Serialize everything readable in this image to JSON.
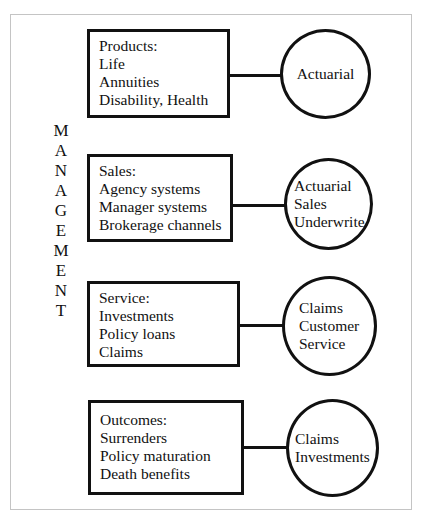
{
  "diagram": {
    "side_label": "MANAGEMENT",
    "side_letters": [
      "M",
      "A",
      "N",
      "A",
      "G",
      "E",
      "M",
      "E",
      "N",
      "T"
    ],
    "rows": [
      {
        "box": {
          "title": "Products:",
          "items": [
            "Life",
            "Annuities",
            "Disability, Health"
          ]
        },
        "circle": {
          "lines": [
            "Actuarial"
          ]
        }
      },
      {
        "box": {
          "title": "Sales:",
          "items": [
            "Agency systems",
            "Manager systems",
            "Brokerage channels"
          ]
        },
        "circle": {
          "lines": [
            "Actuarial",
            "Sales",
            "Underwrite"
          ]
        }
      },
      {
        "box": {
          "title": "Service:",
          "items": [
            "Investments",
            "Policy loans",
            "Claims"
          ]
        },
        "circle": {
          "lines": [
            "Claims",
            "Customer",
            "Service"
          ]
        }
      },
      {
        "box": {
          "title": "Outcomes:",
          "items": [
            "Surrenders",
            "Policy maturation",
            "Death benefits"
          ]
        },
        "circle": {
          "lines": [
            "Claims",
            "Investments"
          ]
        }
      }
    ],
    "colors": {
      "stroke": "#111111",
      "frame": "#c4c4c4",
      "background": "#ffffff"
    }
  }
}
